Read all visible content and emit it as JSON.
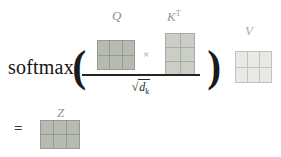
{
  "formula": {
    "softmax_label": "softmax",
    "open_paren": "(",
    "close_paren": ")",
    "multiply_sign": "×",
    "equals_sign": "=",
    "denominator": {
      "radical_sign": "√",
      "base": "d",
      "subscript": "k"
    }
  },
  "matrices": {
    "q": {
      "label": "Q",
      "rows": 2,
      "cols": 3,
      "fill": "#b7bab1",
      "line": "#979a92"
    },
    "kt": {
      "label_base": "K",
      "label_sup": "T",
      "rows": 3,
      "cols": 2,
      "fill": "#cbcdc7",
      "line": "#a9aba5"
    },
    "v": {
      "label": "V",
      "rows": 2,
      "cols": 3,
      "fill": "#e9eae6",
      "line": "#c1c3be"
    },
    "z": {
      "label": "Z",
      "rows": 2,
      "cols": 3,
      "fill": "#b7bab1",
      "line": "#979a92"
    }
  },
  "colors": {
    "background": "#ffffff",
    "formula_text": "#151515",
    "label_gray": "#8d8d8d",
    "fraction_bar": "#242424"
  }
}
